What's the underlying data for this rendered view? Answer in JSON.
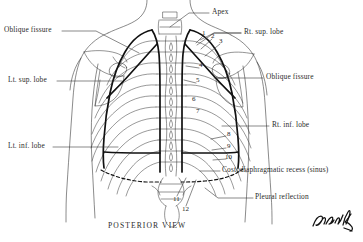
{
  "figure": {
    "title": "POSTERIOR  VIEW",
    "background_color": "#ffffff",
    "ink_color": "#1a1a1a",
    "signature_text": "Pansky"
  },
  "labels_left": [
    {
      "id": "oblique-fissure-left",
      "text": "Oblique fissure",
      "x": 4,
      "y": 29,
      "leader_to_x": 138,
      "leader_to_y": 52
    },
    {
      "id": "lt-sup-lobe",
      "text": "Lt. sup. lobe",
      "x": 8,
      "y": 78,
      "leader_to_x": 122,
      "leader_to_y": 84
    },
    {
      "id": "lt-inf-lobe",
      "text": "Lt. inf. lobe",
      "x": 8,
      "y": 144,
      "leader_to_x": 118,
      "leader_to_y": 148
    }
  ],
  "labels_right": [
    {
      "id": "apex",
      "text": "Apex",
      "x": 212,
      "y": 10,
      "leader_to_x": 168,
      "leader_to_y": 26
    },
    {
      "id": "rt-sup-lobe",
      "text": "Rt. sup. lobe",
      "x": 243,
      "y": 31,
      "leader_to_x": 196,
      "leader_to_y": 44
    },
    {
      "id": "oblique-fissure-right",
      "text": "Oblique fissure",
      "x": 265,
      "y": 75,
      "leader_to_x": 214,
      "leader_to_y": 80
    },
    {
      "id": "rt-inf-lobe",
      "text": "Rt. inf. lobe",
      "x": 271,
      "y": 124,
      "leader_to_x": 222,
      "leader_to_y": 128
    },
    {
      "id": "costodiaphragmatic-recess",
      "text": "Costodiaphragmatic recess (sinus)",
      "x": 222,
      "y": 168,
      "leader_to_x": 205,
      "leader_to_y": 171
    },
    {
      "id": "pleural-reflection",
      "text": "Pleural reflection",
      "x": 255,
      "y": 196,
      "leader_to_x": 205,
      "leader_to_y": 190
    }
  ],
  "rib_numbers": [
    {
      "n": "1",
      "x": 204,
      "y": 33
    },
    {
      "n": "2",
      "x": 213,
      "y": 36
    },
    {
      "n": "3",
      "x": 221,
      "y": 41
    },
    {
      "n": "4",
      "x": 201,
      "y": 65
    },
    {
      "n": "5",
      "x": 198,
      "y": 80
    },
    {
      "n": "6",
      "x": 194,
      "y": 98
    },
    {
      "n": "7",
      "x": 198,
      "y": 110
    },
    {
      "n": "8",
      "x": 228,
      "y": 133
    },
    {
      "n": "9",
      "x": 228,
      "y": 145
    },
    {
      "n": "10",
      "x": 228,
      "y": 156
    },
    {
      "n": "11",
      "x": 175,
      "y": 198
    },
    {
      "n": "12",
      "x": 184,
      "y": 208
    }
  ]
}
